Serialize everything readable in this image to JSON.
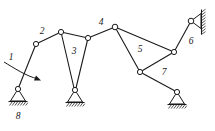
{
  "diagram": {
    "type": "kinematic-linkage-schematic",
    "canvas": {
      "width": 215,
      "height": 131
    },
    "stroke_color": "#1a1a1a",
    "background_color": "#ffffff",
    "joint_fill_color": "#ffffff",
    "labels": [
      {
        "id": "label-1",
        "text": "1",
        "x": 11,
        "y": 58
      },
      {
        "id": "label-2",
        "text": "2",
        "x": 42,
        "y": 32
      },
      {
        "id": "label-3",
        "text": "3",
        "x": 74,
        "y": 52
      },
      {
        "id": "label-4",
        "text": "4",
        "x": 101,
        "y": 23
      },
      {
        "id": "label-5",
        "text": "5",
        "x": 140,
        "y": 50
      },
      {
        "id": "label-6",
        "text": "6",
        "x": 191,
        "y": 42
      },
      {
        "id": "label-7",
        "text": "7",
        "x": 164,
        "y": 73
      },
      {
        "id": "label-8",
        "text": "8",
        "x": 18,
        "y": 117
      }
    ],
    "joints": [
      {
        "id": "joint-a-crank-ground",
        "x": 18,
        "y": 89,
        "r": 2.6,
        "kind": "grounded-pin"
      },
      {
        "id": "joint-b-crank-coupler",
        "x": 36,
        "y": 44,
        "r": 2.6,
        "kind": "pin"
      },
      {
        "id": "joint-c-left-ternary-top",
        "x": 61,
        "y": 32,
        "r": 2.6,
        "kind": "pin"
      },
      {
        "id": "joint-d-right-ternary-top",
        "x": 88,
        "y": 38,
        "r": 2.6,
        "kind": "pin"
      },
      {
        "id": "joint-e-ternary-ground",
        "x": 75,
        "y": 90,
        "r": 2.6,
        "kind": "grounded-pin"
      },
      {
        "id": "joint-f-top-center",
        "x": 115,
        "y": 27,
        "r": 2.8,
        "kind": "pin"
      },
      {
        "id": "joint-g-lower-left",
        "x": 140,
        "y": 72,
        "r": 2.6,
        "kind": "pin"
      },
      {
        "id": "joint-h-right-middle",
        "x": 174,
        "y": 52,
        "r": 2.6,
        "kind": "pin"
      },
      {
        "id": "joint-i-rocker-ground",
        "x": 177,
        "y": 92,
        "r": 2.6,
        "kind": "grounded-pin"
      },
      {
        "id": "joint-j-wall-pin",
        "x": 191,
        "y": 21,
        "r": 2.8,
        "kind": "wall-pin"
      }
    ],
    "links": [
      {
        "id": "link-1-crank",
        "from": "joint-a-crank-ground",
        "to": "joint-b-crank-coupler"
      },
      {
        "id": "link-2-coupler",
        "from": "joint-b-crank-coupler",
        "to": "joint-c-left-ternary-top"
      },
      {
        "id": "link-3-top-bar",
        "from": "joint-c-left-ternary-top",
        "to": "joint-d-right-ternary-top"
      },
      {
        "id": "link-3-left-leg",
        "from": "joint-c-left-ternary-top",
        "to": "joint-e-ternary-ground"
      },
      {
        "id": "link-3-right-leg",
        "from": "joint-d-right-ternary-top",
        "to": "joint-e-ternary-ground"
      },
      {
        "id": "link-4-upper-bar",
        "from": "joint-d-right-ternary-top",
        "to": "joint-f-top-center"
      },
      {
        "id": "link-5-left-side",
        "from": "joint-f-top-center",
        "to": "joint-g-lower-left"
      },
      {
        "id": "link-5-top-side",
        "from": "joint-f-top-center",
        "to": "joint-h-right-middle"
      },
      {
        "id": "link-5-bottom-side",
        "from": "joint-g-lower-left",
        "to": "joint-h-right-middle"
      },
      {
        "id": "link-6-rocker",
        "from": "joint-h-right-middle",
        "to": "joint-j-wall-pin"
      },
      {
        "id": "link-7-rocker",
        "from": "joint-g-lower-left",
        "to": "joint-i-rocker-ground"
      }
    ],
    "ground_supports": [
      {
        "id": "ground-support-8-left",
        "pin_x": 18,
        "pin_y": 89,
        "base_y": 101,
        "half_width": 9,
        "hatch_count": 7
      },
      {
        "id": "ground-support-center",
        "pin_x": 75,
        "pin_y": 90,
        "base_y": 102,
        "half_width": 9,
        "hatch_count": 7
      },
      {
        "id": "ground-support-right",
        "pin_x": 177,
        "pin_y": 92,
        "base_y": 104,
        "half_width": 9,
        "hatch_count": 7
      }
    ],
    "wall_support": {
      "id": "wall-support-top-right",
      "pin_x": 191,
      "pin_y": 21,
      "wall_x": 201,
      "wall_top": 9,
      "wall_bottom": 35,
      "hatch_count": 8,
      "orientation": "vertical-right-facing"
    },
    "rotation_arrow": {
      "id": "crank-rotation-arrow",
      "description": "curved arrow indicating crank 1 input rotation, sweeping clockwise",
      "start_x": 4,
      "start_y": 63,
      "end_x": 40,
      "end_y": 80,
      "arrowhead_x": 40,
      "arrowhead_y": 80
    }
  }
}
